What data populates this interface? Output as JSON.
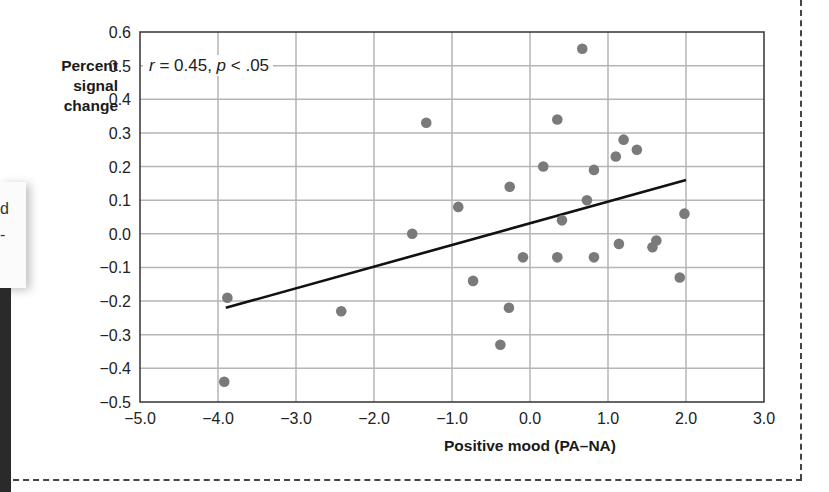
{
  "left_fragment": {
    "line1": "d",
    "line2": "-"
  },
  "chart_data": {
    "type": "scatter",
    "title": "",
    "xlabel": "Positive mood (PA–NA)",
    "ylabel": "Percent signal change",
    "ylabel_lines": [
      "Percent",
      "signal",
      "change"
    ],
    "xlim": [
      -5.0,
      3.0
    ],
    "ylim": [
      -0.5,
      0.6
    ],
    "x_ticks": [
      -5.0,
      -4.0,
      -3.0,
      -2.0,
      -1.0,
      0.0,
      1.0,
      2.0,
      3.0
    ],
    "x_tick_labels": [
      "−5.0",
      "−4.0",
      "−3.0",
      "−2.0",
      "−1.0",
      "0.0",
      "1.0",
      "2.0",
      "3.0"
    ],
    "y_ticks": [
      0.6,
      0.5,
      0.4,
      0.3,
      0.2,
      0.1,
      0.0,
      -0.1,
      -0.2,
      -0.3,
      -0.4,
      -0.5
    ],
    "y_tick_labels": [
      "0.6",
      "0.5",
      "0.4",
      "0.3",
      "0.2",
      "0.1",
      "0.0",
      "−0.1",
      "−0.2",
      "−0.3",
      "−0.4",
      "−0.5"
    ],
    "grid": true,
    "legend": null,
    "annotation": {
      "r_symbol": "r",
      "r_text": " = 0.45, ",
      "p_symbol": "p",
      "p_text": " < .05"
    },
    "series": [
      {
        "name": "participants",
        "marker": "circle",
        "color": "#7a7a7a",
        "points": [
          [
            -3.88,
            -0.19
          ],
          [
            -3.92,
            -0.44
          ],
          [
            -2.42,
            -0.23
          ],
          [
            -1.51,
            0.0
          ],
          [
            -1.33,
            0.33
          ],
          [
            -0.92,
            0.08
          ],
          [
            -0.73,
            -0.14
          ],
          [
            -0.38,
            -0.33
          ],
          [
            -0.27,
            -0.22
          ],
          [
            -0.26,
            0.14
          ],
          [
            -0.09,
            -0.07
          ],
          [
            0.17,
            0.2
          ],
          [
            0.35,
            0.34
          ],
          [
            0.35,
            -0.07
          ],
          [
            0.41,
            0.04
          ],
          [
            0.67,
            0.55
          ],
          [
            0.73,
            0.1
          ],
          [
            0.82,
            0.19
          ],
          [
            0.82,
            -0.07
          ],
          [
            1.1,
            0.23
          ],
          [
            1.14,
            -0.03
          ],
          [
            1.2,
            0.28
          ],
          [
            1.37,
            0.25
          ],
          [
            1.57,
            -0.04
          ],
          [
            1.62,
            -0.02
          ],
          [
            1.92,
            -0.13
          ],
          [
            1.98,
            0.06
          ]
        ]
      }
    ],
    "regression_line": {
      "color": "#111111",
      "from": [
        -3.9,
        -0.22
      ],
      "to": [
        2.0,
        0.16
      ]
    }
  }
}
